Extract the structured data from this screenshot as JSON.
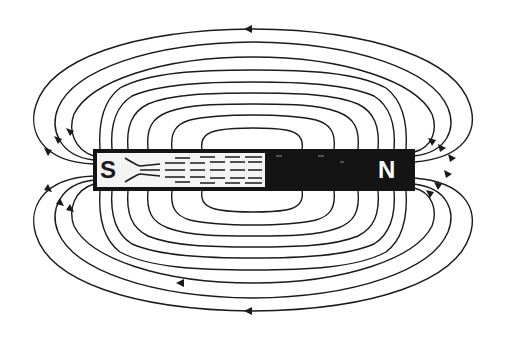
{
  "diagram": {
    "type": "bar-magnet-field-lines",
    "magnet": {
      "south_label": "S",
      "north_label": "N",
      "south_color": "#f4f4f4",
      "north_color": "#141414"
    },
    "field_line_color": "#1a1a1a",
    "arrow_direction": "from N around to S (leftward on top and bottom outer loops)"
  }
}
